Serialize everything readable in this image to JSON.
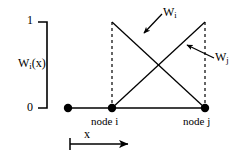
{
  "figure": {
    "kind": "shape-function-diagram",
    "axes": {
      "y_label": "W",
      "y_label_sub": "i",
      "y_label_tail": "(x)",
      "y_ticks": [
        {
          "value": "1",
          "y_px": 22
        },
        {
          "value": "0",
          "y_px": 108
        }
      ],
      "x_arrow_label": "x"
    },
    "nodes": [
      {
        "name": "origin-node",
        "label": "",
        "x_px": 68,
        "y_px": 108
      },
      {
        "name": "node-i",
        "label": "node i",
        "x_px": 112,
        "y_px": 108
      },
      {
        "name": "node-j",
        "label": "node j",
        "x_px": 205,
        "y_px": 108
      }
    ],
    "curves": [
      {
        "name": "Wi",
        "label": "W",
        "label_sub": "i",
        "description": "descending hat function from value 1 at node i to 0 at node j",
        "points": [
          [
            112,
            22
          ],
          [
            205,
            108
          ]
        ]
      },
      {
        "name": "Wj",
        "label": "W",
        "label_sub": "j",
        "description": "ascending hat function from value 0 at node i to 1 at node j",
        "points": [
          [
            112,
            108
          ],
          [
            205,
            22
          ]
        ]
      }
    ],
    "baseline": {
      "from_x_px": 68,
      "to_x_px": 205,
      "y_px": 108
    },
    "dashed_verticals": [
      {
        "x_px": 112,
        "from_y_px": 22,
        "to_y_px": 108
      },
      {
        "x_px": 205,
        "from_y_px": 22,
        "to_y_px": 108
      }
    ],
    "annotations": [
      {
        "name": "wi-arrow",
        "points_to": "Wi",
        "from": [
          162,
          14
        ],
        "to": [
          143,
          34
        ]
      },
      {
        "name": "wj-arrow",
        "points_to": "Wj",
        "from": [
          214,
          58
        ],
        "to": [
          186,
          44
        ]
      }
    ],
    "colors": {
      "ink": "#000000",
      "background": "#ffffff"
    }
  }
}
